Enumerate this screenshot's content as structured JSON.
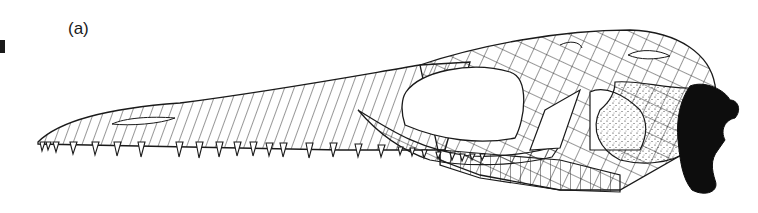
{
  "figure": {
    "panel_label": "(a)",
    "colors": {
      "line": "#1a1a1a",
      "background": "#ffffff",
      "fill_dark": "#0d0d0d"
    }
  }
}
